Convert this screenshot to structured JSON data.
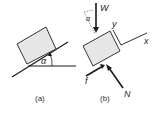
{
  "figure": {
    "panels": [
      {
        "id": "a",
        "caption": "(a)",
        "description": "Block resting on inclined plane",
        "angle_label": "α"
      },
      {
        "id": "b",
        "caption": "(b)",
        "description": "Free-body diagram of block",
        "angle_label": "α",
        "forces": [
          "W",
          "f",
          "N"
        ],
        "axes": [
          "x",
          "y"
        ]
      }
    ]
  },
  "colors": {
    "line": "#1a1a1a",
    "block_fill": "#e6e6e6",
    "block_stroke": "#333333"
  }
}
